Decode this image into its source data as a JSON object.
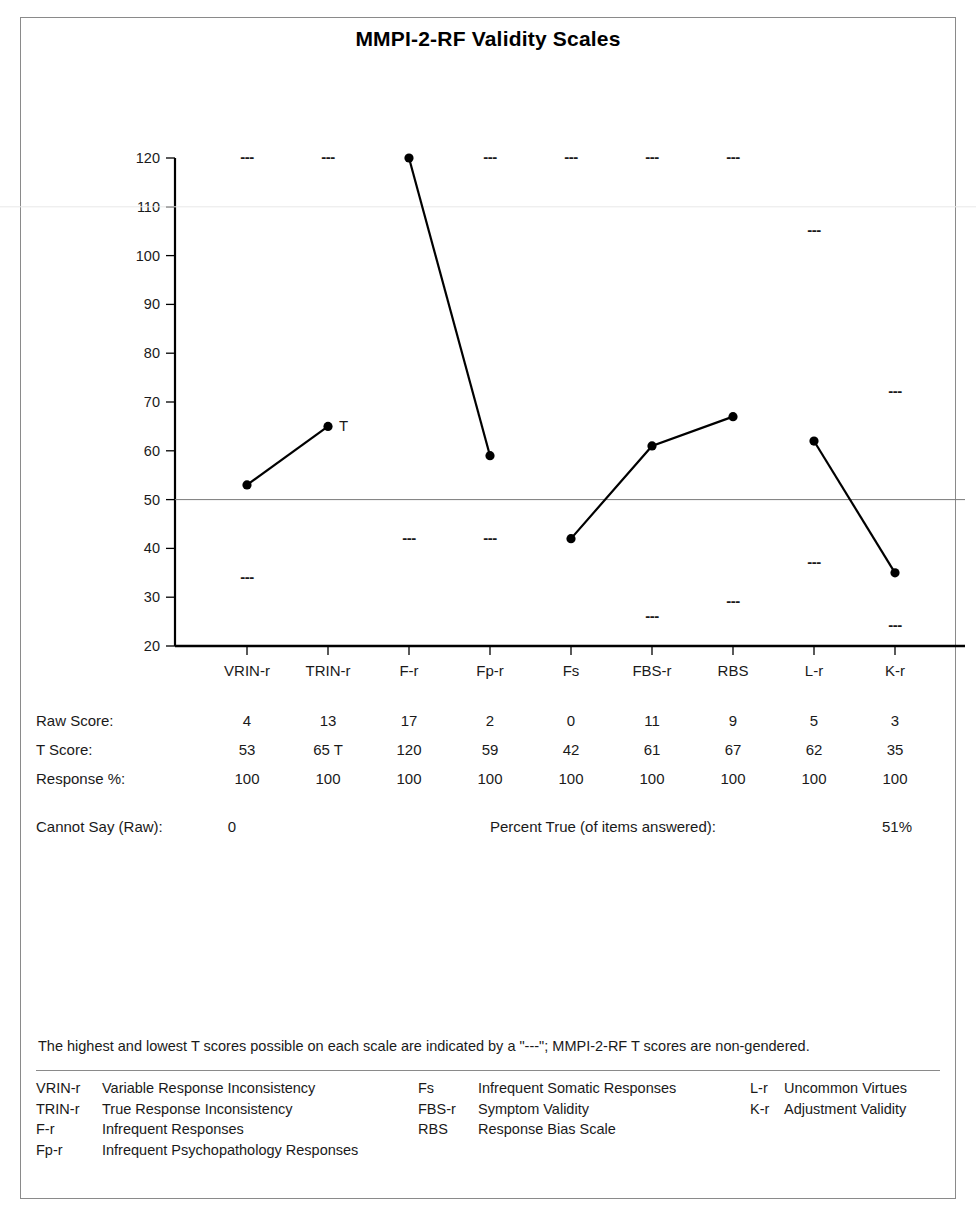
{
  "title": "MMPI-2-RF Validity Scales",
  "chart_data": {
    "type": "line",
    "title": "MMPI-2-RF Validity Scales",
    "xlabel": "",
    "ylabel": "",
    "ylim": [
      20,
      120
    ],
    "yticks": [
      20,
      30,
      40,
      50,
      60,
      70,
      80,
      90,
      100,
      110,
      120
    ],
    "grid": false,
    "reference_line": 50,
    "categories": [
      "VRIN-r",
      "TRIN-r",
      "F-r",
      "Fp-r",
      "Fs",
      "FBS-r",
      "RBS",
      "L-r",
      "K-r"
    ],
    "values": [
      53,
      65,
      120,
      59,
      42,
      61,
      67,
      62,
      35
    ],
    "point_annotations": [
      null,
      "T",
      null,
      null,
      null,
      null,
      null,
      null,
      null
    ],
    "line_segments": [
      [
        0,
        1
      ],
      [
        2,
        3
      ],
      [
        4,
        5,
        6
      ],
      [
        7,
        8
      ]
    ],
    "max_possible": [
      120,
      120,
      120,
      120,
      120,
      120,
      120,
      105,
      72
    ],
    "min_possible": [
      34,
      50,
      42,
      42,
      42,
      26,
      29,
      37,
      24
    ],
    "series": [
      {
        "name": "T Score",
        "values": [
          53,
          65,
          120,
          59,
          42,
          61,
          67,
          62,
          35
        ]
      }
    ]
  },
  "table": {
    "rows": [
      {
        "label": "Raw Score:",
        "values": [
          "4",
          "13",
          "17",
          "2",
          "0",
          "11",
          "9",
          "5",
          "3"
        ]
      },
      {
        "label": "T Score:",
        "values": [
          "53",
          "65 T",
          "120",
          "59",
          "42",
          "61",
          "67",
          "62",
          "35"
        ]
      },
      {
        "label": "Response %:",
        "values": [
          "100",
          "100",
          "100",
          "100",
          "100",
          "100",
          "100",
          "100",
          "100"
        ]
      }
    ]
  },
  "summary": {
    "cannot_say_label": "Cannot Say (Raw):",
    "cannot_say_value": "0",
    "percent_true_label": "Percent True (of items answered):",
    "percent_true_value": "51%"
  },
  "footnote": "The highest and lowest T scores possible on each scale are indicated by a \"---\"; MMPI-2-RF T scores are non-gendered.",
  "legend": {
    "column_1": [
      {
        "abbr": "VRIN-r",
        "desc": "Variable Response Inconsistency"
      },
      {
        "abbr": "TRIN-r",
        "desc": "True Response Inconsistency"
      },
      {
        "abbr": "F-r",
        "desc": "Infrequent Responses"
      },
      {
        "abbr": "Fp-r",
        "desc": "Infrequent Psychopathology Responses"
      }
    ],
    "column_2": [
      {
        "abbr": "Fs",
        "desc": "Infrequent Somatic Responses"
      },
      {
        "abbr": "FBS-r",
        "desc": "Symptom Validity"
      },
      {
        "abbr": "RBS",
        "desc": "Response Bias Scale"
      }
    ],
    "column_3": [
      {
        "abbr": "L-r",
        "desc": "Uncommon Virtues"
      },
      {
        "abbr": "K-r",
        "desc": "Adjustment Validity"
      }
    ]
  },
  "colors": {
    "line": "#000000",
    "axis": "#000000",
    "reference_line": "#7a7a7a",
    "border": "#8a8a8a",
    "text": "#1a1a1a"
  }
}
